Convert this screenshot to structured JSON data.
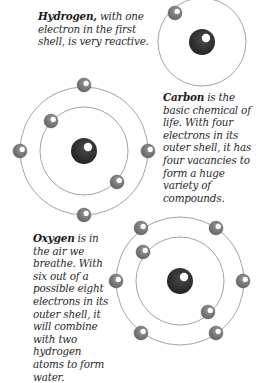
{
  "captions": {
    "hydrogen": {
      "name": "Hydrogen,",
      "text": " with one electron in the first shell, is very reactive."
    },
    "carbon": {
      "name": "Carbon",
      "text": " is the basic chemical of life. With four electrons in its outer shell, it has four vacancies to form a huge variety of compounds."
    },
    "oxygen": {
      "name": "Oxygen",
      "text": " is in the air we breathe. With six out of a possible eight electrons in its outer shell, it will combine with two hydrogen atoms to form water."
    }
  },
  "colors": {
    "nucleus": "#2e2e2e",
    "electron": "#808080",
    "orbit": "#8a8a8a",
    "highlight": "#ffffff"
  },
  "atoms": [
    {
      "element": "Hydrogen",
      "nucleus": [
        202,
        42
      ],
      "orbits": [
        44
      ],
      "electrons": [
        [
          175,
          13
        ]
      ]
    },
    {
      "element": "Carbon",
      "nucleus": [
        84,
        151
      ],
      "orbits": [
        44,
        64
      ],
      "electrons": [
        [
          84,
          85
        ],
        [
          20,
          151
        ],
        [
          148,
          151
        ],
        [
          84,
          215
        ],
        [
          51,
          121
        ],
        [
          117,
          182
        ]
      ]
    },
    {
      "element": "Oxygen",
      "nucleus": [
        180,
        281
      ],
      "orbits": [
        44,
        64
      ],
      "electrons": [
        [
          141,
          228
        ],
        [
          216,
          228
        ],
        [
          116,
          281
        ],
        [
          243,
          281
        ],
        [
          141,
          333
        ],
        [
          216,
          333
        ],
        [
          143,
          252
        ],
        [
          208,
          312
        ]
      ]
    }
  ]
}
